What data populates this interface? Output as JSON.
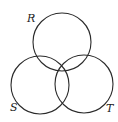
{
  "diagram": {
    "type": "venn",
    "sets": [
      {
        "label": "R",
        "cx": 62,
        "cy": 42,
        "r": 29,
        "label_x": 27,
        "label_y": 22
      },
      {
        "label": "S",
        "cx": 40,
        "cy": 85,
        "r": 29,
        "label_x": 10,
        "label_y": 111
      },
      {
        "label": "T",
        "cx": 84,
        "cy": 84,
        "r": 29,
        "label_x": 106,
        "label_y": 112
      }
    ],
    "stroke_color": "#2a2a2a",
    "background": "#ffffff"
  }
}
